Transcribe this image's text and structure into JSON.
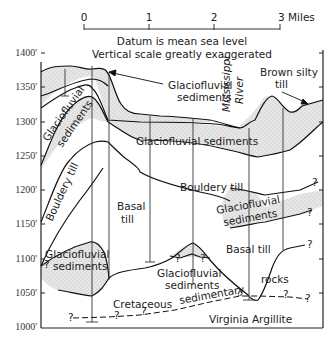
{
  "scale_bar": {
    "ticks": [
      "0",
      "1",
      "2",
      "3 Miles"
    ],
    "unit": "Miles"
  },
  "notes": {
    "datum": "Datum is mean sea level",
    "vertical": "Vertical scale greatly exaggerated"
  },
  "y_axis": {
    "ticks": [
      "1400'",
      "1350'",
      "1300'",
      "1250'",
      "1200'",
      "1150'",
      "1100'",
      "1050'",
      "1000'"
    ]
  },
  "labels": {
    "glaciofluvial_top_right_1": "Glaciofluvial",
    "glaciofluvial_top_right_2": "sediments",
    "brown_silty_1": "Brown silty",
    "brown_silty_2": "till",
    "mississippi": "Mississippi",
    "river": "River",
    "glaciofluvial_left_1": "Glaciofluvial",
    "glaciofluvial_left_2": "sediments",
    "glaciofluvial_band": "Glaciofluvial sediments",
    "bouldery_till_left": "Bouldery till",
    "basal_till_1": "Basal",
    "basal_till_2": "till",
    "bouldery_till_center": "Bouldery till",
    "glaciofluvial_right_1": "Glaciofluvial",
    "glaciofluvial_right_2": "sediments",
    "glaciofluvial_bl_1": "Glaciofluvial",
    "glaciofluvial_bl_2": "sediments",
    "glaciofluvial_bc_1": "Glaciofluvial",
    "glaciofluvial_bc_2": "sediments",
    "basal_till_right": "Basal till",
    "cretaceous": "Cretaceous",
    "sedimentary": "sedimentary",
    "rocks": "rocks",
    "virginia_argillite": "Virginia Argillite",
    "q": "?"
  }
}
